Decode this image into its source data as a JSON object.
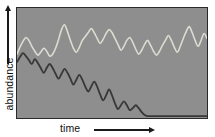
{
  "figure": {
    "background_color": "#ffffff",
    "panel_color": "#8e8e8e",
    "panel_border_color": "#2a2a2a"
  },
  "axes": {
    "y": {
      "label": "abundance",
      "arrow_icon": "up-arrow-icon",
      "direction": "up"
    },
    "x": {
      "label": "time",
      "arrow_icon": "right-arrow-icon",
      "direction": "right"
    }
  },
  "chart_data": {
    "type": "line",
    "title": "",
    "xlabel": "time",
    "ylabel": "abundance",
    "xlim": [
      0,
      192
    ],
    "ylim": [
      0,
      112
    ],
    "grid": false,
    "legend": null,
    "axis_ticks": false,
    "series": [
      {
        "name": "stable-population",
        "color": "#dcdcd2",
        "line_width": 1.6,
        "description": "Oscillating series that stays high across the whole time span, with oscillation frequency increasing toward the right.",
        "points": [
          [
            0,
            47
          ],
          [
            3,
            40
          ],
          [
            6,
            34
          ],
          [
            9,
            30
          ],
          [
            12,
            33
          ],
          [
            15,
            39
          ],
          [
            18,
            44
          ],
          [
            21,
            48
          ],
          [
            24,
            45
          ],
          [
            27,
            41
          ],
          [
            30,
            44
          ],
          [
            33,
            49
          ],
          [
            36,
            47
          ],
          [
            39,
            41
          ],
          [
            42,
            32
          ],
          [
            45,
            22
          ],
          [
            48,
            17
          ],
          [
            51,
            24
          ],
          [
            54,
            33
          ],
          [
            57,
            41
          ],
          [
            60,
            45
          ],
          [
            63,
            40
          ],
          [
            66,
            33
          ],
          [
            69,
            29
          ],
          [
            72,
            25
          ],
          [
            75,
            21
          ],
          [
            78,
            25
          ],
          [
            81,
            31
          ],
          [
            84,
            36
          ],
          [
            87,
            32
          ],
          [
            90,
            26
          ],
          [
            93,
            22
          ],
          [
            96,
            25
          ],
          [
            99,
            31
          ],
          [
            102,
            37
          ],
          [
            105,
            43
          ],
          [
            108,
            39
          ],
          [
            111,
            33
          ],
          [
            114,
            30
          ],
          [
            117,
            35
          ],
          [
            120,
            42
          ],
          [
            123,
            47
          ],
          [
            126,
            43
          ],
          [
            129,
            37
          ],
          [
            132,
            33
          ],
          [
            135,
            38
          ],
          [
            138,
            44
          ],
          [
            141,
            48
          ],
          [
            144,
            44
          ],
          [
            147,
            38
          ],
          [
            150,
            33
          ],
          [
            153,
            28
          ],
          [
            156,
            33
          ],
          [
            159,
            40
          ],
          [
            162,
            45
          ],
          [
            165,
            39
          ],
          [
            168,
            31
          ],
          [
            171,
            24
          ],
          [
            174,
            19
          ],
          [
            177,
            25
          ],
          [
            180,
            33
          ],
          [
            183,
            39
          ],
          [
            186,
            33
          ],
          [
            189,
            26
          ],
          [
            192,
            31
          ]
        ]
      },
      {
        "name": "declining-population",
        "color": "#383838",
        "line_width": 1.8,
        "description": "Oscillating series whose mean declines steadily and whose oscillation amplitude grows until it collapses to near zero around the middle of the time span, then stays flat at the baseline.",
        "points": [
          [
            0,
            55
          ],
          [
            3,
            50
          ],
          [
            6,
            46
          ],
          [
            9,
            49
          ],
          [
            12,
            53
          ],
          [
            15,
            57
          ],
          [
            18,
            52
          ],
          [
            21,
            56
          ],
          [
            24,
            61
          ],
          [
            27,
            66
          ],
          [
            30,
            61
          ],
          [
            33,
            57
          ],
          [
            36,
            61
          ],
          [
            39,
            67
          ],
          [
            42,
            72
          ],
          [
            45,
            67
          ],
          [
            48,
            62
          ],
          [
            51,
            66
          ],
          [
            54,
            72
          ],
          [
            57,
            78
          ],
          [
            60,
            73
          ],
          [
            63,
            68
          ],
          [
            66,
            73
          ],
          [
            69,
            80
          ],
          [
            72,
            85
          ],
          [
            75,
            80
          ],
          [
            78,
            75
          ],
          [
            81,
            80
          ],
          [
            84,
            88
          ],
          [
            87,
            94
          ],
          [
            90,
            89
          ],
          [
            93,
            83
          ],
          [
            96,
            89
          ],
          [
            99,
            97
          ],
          [
            102,
            103
          ],
          [
            105,
            99
          ],
          [
            108,
            95
          ],
          [
            111,
            99
          ],
          [
            114,
            104
          ],
          [
            117,
            102
          ],
          [
            120,
            99
          ],
          [
            123,
            102
          ],
          [
            126,
            106
          ],
          [
            129,
            109
          ],
          [
            132,
            110
          ],
          [
            135,
            110
          ],
          [
            140,
            110
          ],
          [
            150,
            110
          ],
          [
            160,
            110
          ],
          [
            170,
            110
          ],
          [
            180,
            110
          ],
          [
            192,
            110
          ]
        ]
      }
    ]
  }
}
